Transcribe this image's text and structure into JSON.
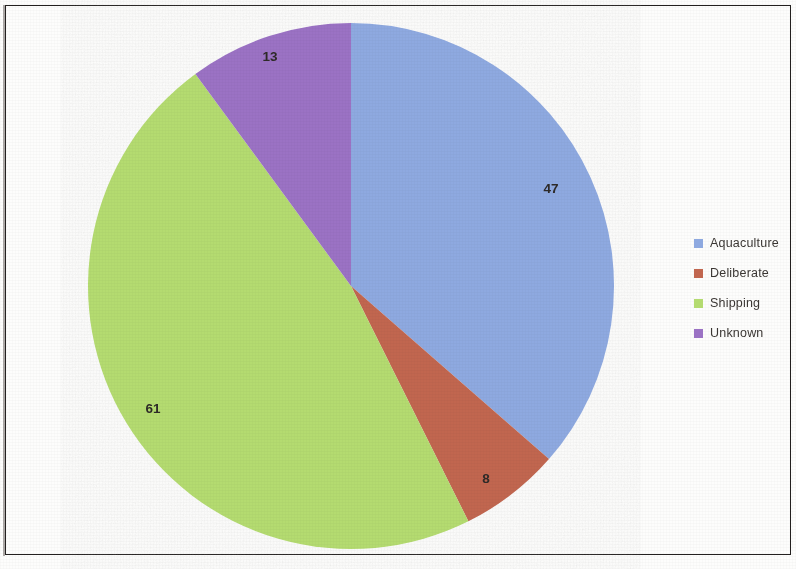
{
  "chart_data": {
    "type": "pie",
    "title": "",
    "categories": [
      "Aquaculture",
      "Deliberate",
      "Shipping",
      "Unknown"
    ],
    "values": [
      47,
      8,
      61,
      13
    ],
    "total": 129,
    "colors": [
      "#8EA9E0",
      "#C1664F",
      "#B4DB70",
      "#9B72C4"
    ],
    "data_labels": [
      "47",
      "8",
      "61",
      "13"
    ],
    "start_angle_deg": 0,
    "direction": "clockwise",
    "legend_position": "right",
    "grid": false,
    "xlabel": "",
    "ylabel": ""
  },
  "legend": {
    "items": [
      {
        "label": "Aquaculture",
        "color": "#8EA9E0",
        "value": "47"
      },
      {
        "label": "Deliberate",
        "color": "#C1664F",
        "value": "8"
      },
      {
        "label": "Shipping",
        "color": "#B4DB70",
        "value": "61"
      },
      {
        "label": "Unknown",
        "color": "#9B72C4",
        "value": "13"
      }
    ]
  },
  "pie": {
    "center_x": 351,
    "center_y": 286,
    "radius": 263,
    "label_positions": [
      {
        "text": "47",
        "x": 551,
        "y": 193
      },
      {
        "text": "8",
        "x": 486,
        "y": 483
      },
      {
        "text": "61",
        "x": 153,
        "y": 413
      },
      {
        "text": "13",
        "x": 270,
        "y": 61
      }
    ]
  }
}
